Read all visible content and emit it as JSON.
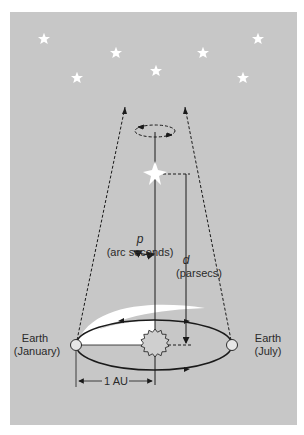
{
  "figure": {
    "background_color": "#c7c7c7",
    "colors": {
      "line": "#1a1a1a",
      "star": "#ffffff",
      "highlight": "#ffffff"
    }
  },
  "labels": {
    "parallax_symbol": "p",
    "parallax_unit": "(arc seconds)",
    "distance_symbol": "d",
    "distance_unit": "(parsecs)",
    "earth_january_line1": "Earth",
    "earth_january_line2": "(January)",
    "earth_july_line1": "Earth",
    "earth_july_line2": "(July)",
    "baseline": "1 AU"
  },
  "background_stars": [
    {
      "x": 44,
      "y": 39
    },
    {
      "x": 116,
      "y": 53
    },
    {
      "x": 77,
      "y": 78
    },
    {
      "x": 156,
      "y": 71
    },
    {
      "x": 203,
      "y": 53
    },
    {
      "x": 258,
      "y": 39
    },
    {
      "x": 243,
      "y": 78
    }
  ],
  "nearby_star": {
    "x": 155,
    "y": 173
  },
  "sun": {
    "x": 155,
    "y": 345,
    "r": 13
  },
  "earth_positions": [
    {
      "name": "January",
      "x": 76,
      "y": 345
    },
    {
      "name": "July",
      "x": 232,
      "y": 345
    }
  ]
}
